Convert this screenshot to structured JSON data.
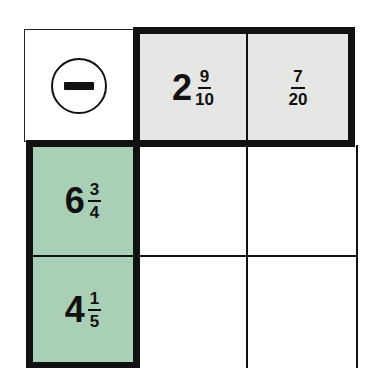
{
  "puzzle": {
    "operation": "subtraction",
    "operator_icon": "minus-circle-icon",
    "colors": {
      "header_top_fill": "#e6e6e4",
      "header_left_fill": "#a9cfb7",
      "grid_line": "#111111",
      "empty_fill": "#ffffff"
    },
    "top_headers": [
      {
        "whole": "2",
        "numerator": "9",
        "denominator": "10"
      },
      {
        "whole": "",
        "numerator": "7",
        "denominator": "20"
      }
    ],
    "left_headers": [
      {
        "whole": "6",
        "numerator": "3",
        "denominator": "4"
      },
      {
        "whole": "4",
        "numerator": "1",
        "denominator": "5"
      }
    ],
    "answers": [
      [
        "",
        ""
      ],
      [
        "",
        ""
      ]
    ]
  }
}
